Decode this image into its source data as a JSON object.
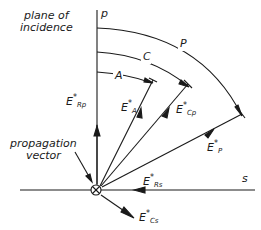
{
  "diagram": {
    "title_lines": [
      "plane of",
      "incidence"
    ],
    "axes": {
      "p": "p",
      "s": "s"
    },
    "propagation_label": [
      "propagation",
      "vector"
    ],
    "arcs": [
      {
        "id": "A",
        "label": "A"
      },
      {
        "id": "C",
        "label": "C"
      },
      {
        "id": "P",
        "label": "P"
      }
    ],
    "vectors": {
      "E_Rp": {
        "base": "E",
        "star": "*",
        "sub": "Rp"
      },
      "E_A": {
        "base": "E",
        "star": "*",
        "sub": "A"
      },
      "E_Cp": {
        "base": "E",
        "star": "*",
        "sub": "Cp"
      },
      "E_P": {
        "base": "E",
        "star": "*",
        "sub": "P"
      },
      "E_Rs": {
        "base": "E",
        "star": "*",
        "sub": "Rs"
      },
      "E_Cs": {
        "base": "E",
        "star": "*",
        "sub": "Cs"
      }
    },
    "colors": {
      "ink": "#1a1a1a",
      "background": "#ffffff"
    }
  }
}
